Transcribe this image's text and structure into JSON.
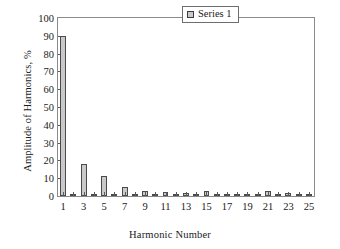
{
  "chart_data": {
    "type": "bar",
    "title": "",
    "xlabel": "Harmonic Number",
    "ylabel": "Amplitude of Harmonics, %",
    "ylim": [
      0,
      100
    ],
    "yticks": [
      0,
      10,
      20,
      30,
      40,
      50,
      60,
      70,
      80,
      90,
      100
    ],
    "ytick_labels": [
      "0",
      "10",
      "20",
      "30",
      "40",
      "50",
      "60",
      "70",
      "80",
      "90",
      "100"
    ],
    "xlim": [
      0.5,
      25.5
    ],
    "grid": false,
    "legend_position": "top-right",
    "legend": [
      "Series 1"
    ],
    "categories": [
      1,
      2,
      3,
      4,
      5,
      6,
      7,
      8,
      9,
      10,
      11,
      12,
      13,
      14,
      15,
      16,
      17,
      18,
      19,
      20,
      21,
      22,
      23,
      24,
      25
    ],
    "xtick_labels": [
      "1",
      "",
      "3",
      "",
      "5",
      "",
      "7",
      "",
      "9",
      "",
      "11",
      "",
      "13",
      "",
      "15",
      "",
      "17",
      "",
      "19",
      "",
      "21",
      "",
      "23",
      "",
      "25"
    ],
    "series": [
      {
        "name": "Series 1",
        "color": "#c9c9c9",
        "edge_color": "#4a4a4a",
        "values": [
          90,
          0.4,
          18,
          0.5,
          11.5,
          0.4,
          5,
          0.6,
          2.8,
          0.5,
          2.0,
          0.4,
          1.8,
          0.4,
          2.8,
          0.5,
          0.3,
          0.3,
          0.3,
          1.0,
          2.8,
          0.4,
          1.8,
          0.3,
          1.2
        ]
      }
    ]
  }
}
